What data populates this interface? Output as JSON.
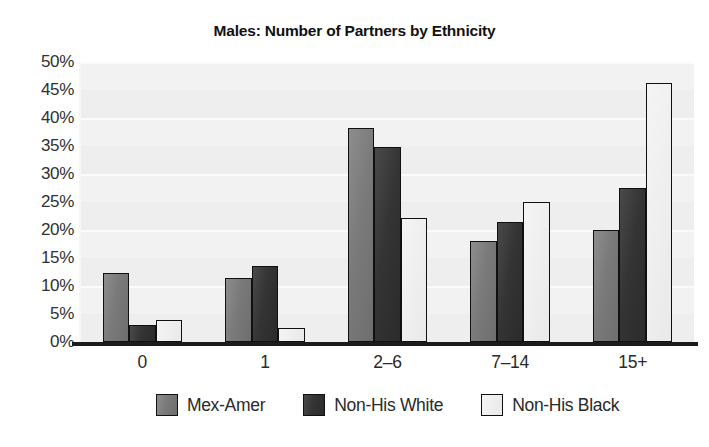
{
  "chart_data": {
    "type": "bar",
    "title": "Males: Number of Partners by Ethnicity",
    "xlabel": "",
    "ylabel": "",
    "categories": [
      "0",
      "1",
      "2–6",
      "7–14",
      "15+"
    ],
    "series": [
      {
        "name": "Mex-Amer",
        "color": "#7a7a7a",
        "values": [
          12.3,
          11.5,
          38.2,
          18.0,
          20.0
        ]
      },
      {
        "name": "Non-His White",
        "color": "#343434",
        "values": [
          3.0,
          13.5,
          34.8,
          21.5,
          27.5
        ]
      },
      {
        "name": "Non-His Black",
        "color": "#efefef",
        "values": [
          4.0,
          2.5,
          22.2,
          25.0,
          46.2
        ]
      }
    ],
    "ylim": [
      0,
      50
    ],
    "ytick_values": [
      0,
      5,
      10,
      15,
      20,
      25,
      30,
      35,
      40,
      45,
      50
    ],
    "ytick_labels": [
      "0%",
      "5%",
      "10%",
      "15%",
      "20%",
      "25%",
      "30%",
      "35%",
      "40%",
      "45%",
      "50%"
    ],
    "grid": true,
    "legend_position": "bottom",
    "plot_background": "#f2f2f2",
    "axis_color": "#1c1c1c"
  },
  "artifact": {
    "text": ""
  }
}
